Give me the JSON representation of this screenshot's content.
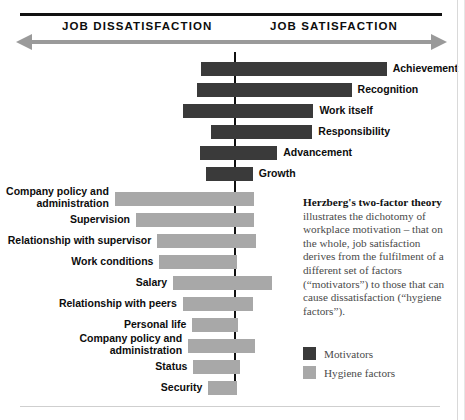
{
  "axis": {
    "left_label": "JOB DISSATISFACTION",
    "right_label": "JOB SATISFACTION"
  },
  "legend": {
    "motivators": "Motivators",
    "hygiene": "Hygiene factors"
  },
  "description": {
    "bold_lead": "Herzberg's two-factor theory",
    "body": " illustrates the dichotomy of workplace motivation – that on the whole, job satisfaction derives from the fulfilment of a different set of factors (“motivators”) to those that can cause dissatisfaction (“hygiene factors”)."
  },
  "colors": {
    "motivator": "#3a3a3a",
    "hygiene": "#a8a8a8",
    "axis_arrow": "#9a9a9a",
    "rule": "#111111",
    "text": "#0d0d0d",
    "body_text": "#4a4a4a"
  },
  "chart_data": {
    "type": "bar",
    "title": "Herzberg's two-factor theory",
    "orientation": "horizontal",
    "center_axis_value": 0,
    "xlabel": "",
    "ylabel": "",
    "axis_left_label": "JOB DISSATISFACTION",
    "axis_right_label": "JOB SATISFACTION",
    "legend": [
      "Motivators",
      "Hygiene factors"
    ],
    "legend_position": "bottom-right",
    "grid": false,
    "note": "Values are percentage-frequency extents read off each bar relative to the central zero line; negative = dissatisfaction side, positive = satisfaction side.",
    "series": [
      {
        "name": "Motivators",
        "color": "#3a3a3a",
        "points": [
          {
            "category": "Achievement",
            "start": -32,
            "end": 143,
            "label_side": "right"
          },
          {
            "category": "Recognition",
            "start": -36,
            "end": 110,
            "label_side": "right"
          },
          {
            "category": "Work itself",
            "start": -49,
            "end": 74,
            "label_side": "right"
          },
          {
            "category": "Responsibility",
            "start": -22,
            "end": 73,
            "label_side": "right"
          },
          {
            "category": "Advancement",
            "start": -33,
            "end": 40,
            "label_side": "right"
          },
          {
            "category": "Growth",
            "start": -27,
            "end": 17,
            "label_side": "right"
          }
        ]
      },
      {
        "name": "Hygiene factors",
        "color": "#a8a8a8",
        "points": [
          {
            "category": "Company policy and administration",
            "start": -113,
            "end": 18,
            "label_side": "left"
          },
          {
            "category": "Supervision",
            "start": -93,
            "end": 18,
            "label_side": "left"
          },
          {
            "category": "Relationship with supervisor",
            "start": -73,
            "end": 20,
            "label_side": "left"
          },
          {
            "category": "Work conditions",
            "start": -71,
            "end": 2,
            "label_side": "left"
          },
          {
            "category": "Salary",
            "start": -58,
            "end": 35,
            "label_side": "left"
          },
          {
            "category": "Relationship with peers",
            "start": -49,
            "end": 17,
            "label_side": "left"
          },
          {
            "category": "Personal life",
            "start": -40,
            "end": 3,
            "label_side": "left"
          },
          {
            "category": "Relationship with subordinates",
            "start": -44,
            "end": 19,
            "label_side": "left"
          },
          {
            "category": "Status",
            "start": -39,
            "end": 5,
            "label_side": "left"
          },
          {
            "category": "Security",
            "start": -25,
            "end": 2,
            "label_side": "left"
          }
        ]
      }
    ]
  }
}
